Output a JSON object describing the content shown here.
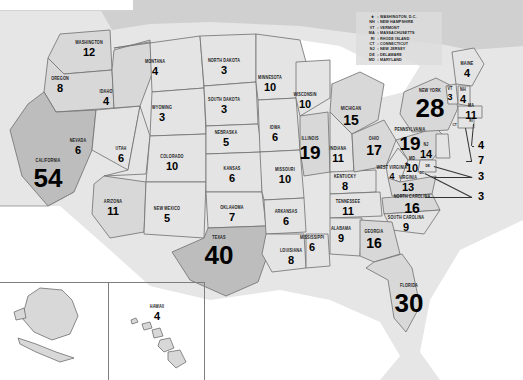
{
  "chart_data": {
    "type": "map",
    "unit": "electoral votes",
    "total": 538,
    "categories": [
      "Alabama",
      "Alaska",
      "Arizona",
      "Arkansas",
      "California",
      "Colorado",
      "Connecticut",
      "Delaware",
      "District of Columbia",
      "Florida",
      "Georgia",
      "Hawaii",
      "Idaho",
      "Illinois",
      "Indiana",
      "Iowa",
      "Kansas",
      "Kentucky",
      "Louisiana",
      "Maine",
      "Maryland",
      "Massachusetts",
      "Michigan",
      "Minnesota",
      "Mississippi",
      "Missouri",
      "Montana",
      "Nebraska",
      "Nevada",
      "New Hampshire",
      "New Jersey",
      "New Mexico",
      "New York",
      "North Carolina",
      "North Dakota",
      "Ohio",
      "Oklahoma",
      "Oregon",
      "Pennsylvania",
      "Rhode Island",
      "South Carolina",
      "South Dakota",
      "Tennessee",
      "Texas",
      "Utah",
      "Vermont",
      "Virginia",
      "Washington",
      "West Virginia",
      "Wisconsin",
      "Wyoming"
    ],
    "values": [
      9,
      3,
      11,
      6,
      54,
      10,
      7,
      3,
      3,
      30,
      16,
      4,
      4,
      19,
      11,
      6,
      6,
      8,
      8,
      4,
      10,
      11,
      15,
      10,
      6,
      10,
      4,
      5,
      6,
      4,
      14,
      5,
      28,
      16,
      3,
      17,
      7,
      8,
      19,
      4,
      9,
      3,
      11,
      40,
      6,
      3,
      13,
      12,
      4,
      10,
      3
    ]
  },
  "states": [
    {
      "id": "washington",
      "name": "WASHINGTON",
      "value": "12",
      "x": 89,
      "y": 49,
      "size": "sz-sm",
      "shade": "f-mid"
    },
    {
      "id": "oregon",
      "name": "OREGON",
      "value": "8",
      "x": 60,
      "y": 85,
      "size": "sz-sm",
      "shade": "f-mid"
    },
    {
      "id": "california",
      "name": "CALIFORNIA",
      "value": "54",
      "x": 48,
      "y": 175,
      "size": "sz-xl",
      "shade": "f-dark"
    },
    {
      "id": "nevada",
      "name": "NEVADA",
      "value": "6",
      "x": 78,
      "y": 147,
      "size": "sz-sm",
      "shade": "f-light"
    },
    {
      "id": "idaho",
      "name": "IDAHO",
      "value": "4",
      "x": 106,
      "y": 98,
      "size": "sz-sm",
      "shade": "f-mid"
    },
    {
      "id": "montana",
      "name": "MONTANA",
      "value": "4",
      "x": 155,
      "y": 68,
      "size": "sz-sm",
      "shade": "f-light"
    },
    {
      "id": "wyoming",
      "name": "WYOMING",
      "value": "3",
      "x": 162,
      "y": 114,
      "size": "sz-sm",
      "shade": "f-light"
    },
    {
      "id": "utah",
      "name": "UTAH",
      "value": "6",
      "x": 121,
      "y": 155,
      "size": "sz-sm",
      "shade": "f-light"
    },
    {
      "id": "colorado",
      "name": "COLORADO",
      "value": "10",
      "x": 172,
      "y": 163,
      "size": "sz-sm",
      "shade": "f-light"
    },
    {
      "id": "arizona",
      "name": "ARIZONA",
      "value": "11",
      "x": 113,
      "y": 208,
      "size": "sz-sm",
      "shade": "f-mid"
    },
    {
      "id": "new-mexico",
      "name": "NEW MEXICO",
      "value": "5",
      "x": 167,
      "y": 215,
      "size": "sz-sm",
      "shade": "f-light"
    },
    {
      "id": "north-dakota",
      "name": "NORTH DAKOTA",
      "value": "3",
      "x": 224,
      "y": 67,
      "size": "sz-sm",
      "shade": "f-light"
    },
    {
      "id": "south-dakota",
      "name": "SOUTH DAKOTA",
      "value": "3",
      "x": 224,
      "y": 106,
      "size": "sz-sm",
      "shade": "f-light"
    },
    {
      "id": "nebraska",
      "name": "NEBRASKA",
      "value": "5",
      "x": 226,
      "y": 139,
      "size": "sz-sm",
      "shade": "f-light"
    },
    {
      "id": "kansas",
      "name": "KANSAS",
      "value": "6",
      "x": 232,
      "y": 175,
      "size": "sz-sm",
      "shade": "f-light"
    },
    {
      "id": "oklahoma",
      "name": "OKLAHOMA",
      "value": "7",
      "x": 232,
      "y": 214,
      "size": "sz-sm",
      "shade": "f-light"
    },
    {
      "id": "texas",
      "name": "TEXAS",
      "value": "40",
      "x": 219,
      "y": 252,
      "size": "sz-xl",
      "shade": "f-dark"
    },
    {
      "id": "minnesota",
      "name": "MINNESOTA",
      "value": "10",
      "x": 270,
      "y": 84,
      "size": "sz-sm",
      "shade": "f-light"
    },
    {
      "id": "iowa",
      "name": "IOWA",
      "value": "6",
      "x": 275,
      "y": 134,
      "size": "sz-sm",
      "shade": "f-light"
    },
    {
      "id": "missouri",
      "name": "MISSOURI",
      "value": "10",
      "x": 285,
      "y": 176,
      "size": "sz-sm",
      "shade": "f-light"
    },
    {
      "id": "arkansas",
      "name": "ARKANSAS",
      "value": "6",
      "x": 286,
      "y": 218,
      "size": "sz-sm",
      "shade": "f-light"
    },
    {
      "id": "louisiana",
      "name": "LOUISIANA",
      "value": "8",
      "x": 291,
      "y": 257,
      "size": "sz-sm",
      "shade": "f-light"
    },
    {
      "id": "wisconsin",
      "name": "WISCONSIN",
      "value": "10",
      "x": 305,
      "y": 101,
      "size": "sz-sm",
      "shade": "f-light"
    },
    {
      "id": "illinois",
      "name": "ILLINOIS",
      "value": "19",
      "x": 310,
      "y": 149,
      "size": "sz-lg",
      "shade": "f-mid"
    },
    {
      "id": "mississippi",
      "name": "MISSISSIPPI",
      "value": "6",
      "x": 312,
      "y": 244,
      "size": "sz-sm",
      "shade": "f-light"
    },
    {
      "id": "michigan",
      "name": "MICHIGAN",
      "value": "15",
      "x": 351,
      "y": 117,
      "size": "sz-md",
      "shade": "f-mid"
    },
    {
      "id": "indiana",
      "name": "INDIANA",
      "value": "11",
      "x": 338,
      "y": 155,
      "size": "sz-sm",
      "shade": "f-light"
    },
    {
      "id": "kentucky",
      "name": "KENTUCKY",
      "value": "8",
      "x": 345,
      "y": 183,
      "size": "sz-sm",
      "shade": "f-light"
    },
    {
      "id": "tennessee",
      "name": "TENNESSEE",
      "value": "11",
      "x": 348,
      "y": 208,
      "size": "sz-sm",
      "shade": "f-light"
    },
    {
      "id": "alabama",
      "name": "ALABAMA",
      "value": "9",
      "x": 341,
      "y": 235,
      "size": "sz-sm",
      "shade": "f-light"
    },
    {
      "id": "ohio",
      "name": "OHIO",
      "value": "17",
      "x": 374,
      "y": 147,
      "size": "sz-md",
      "shade": "f-mid"
    },
    {
      "id": "west-virginia",
      "name": "WEST VIRGINIA",
      "value": "4",
      "x": 392,
      "y": 173,
      "size": "sz-xs",
      "shade": "f-light"
    },
    {
      "id": "virginia",
      "name": "VIRGINIA",
      "value": "13",
      "x": 408,
      "y": 184,
      "size": "sz-sm",
      "shade": "f-mid"
    },
    {
      "id": "north-carolina",
      "name": "NORTH CAROLINA",
      "value": "16",
      "x": 412,
      "y": 205,
      "size": "sz-md",
      "shade": "f-mid"
    },
    {
      "id": "south-carolina",
      "name": "SOUTH CAROLINA",
      "value": "9",
      "x": 406,
      "y": 224,
      "size": "sz-sm",
      "shade": "f-light"
    },
    {
      "id": "georgia",
      "name": "GEORGIA",
      "value": "16",
      "x": 374,
      "y": 240,
      "size": "sz-md",
      "shade": "f-mid"
    },
    {
      "id": "florida",
      "name": "FLORIDA",
      "value": "30",
      "x": 409,
      "y": 300,
      "size": "sz-xl",
      "shade": "f-mid"
    },
    {
      "id": "pennsylvania",
      "name": "PENNSYLVANIA",
      "value": "19",
      "x": 410,
      "y": 140,
      "size": "sz-lg",
      "shade": "f-mid"
    },
    {
      "id": "new-york",
      "name": "NEW YORK",
      "value": "28",
      "x": 430,
      "y": 105,
      "size": "sz-xl",
      "shade": "f-mid"
    },
    {
      "id": "maine",
      "name": "MAINE",
      "value": "4",
      "x": 467,
      "y": 70,
      "size": "sz-sm",
      "shade": "f-light"
    },
    {
      "id": "vermont",
      "name": "VT",
      "value": "3",
      "x": 450,
      "y": 94,
      "size": "sz-xs",
      "shade": "f-light"
    },
    {
      "id": "new-hampshire",
      "name": "NH",
      "value": "4",
      "x": 463,
      "y": 96,
      "size": "sz-sm",
      "shade": "f-light"
    },
    {
      "id": "massachusetts",
      "name": "MA",
      "value": "11",
      "x": 471,
      "y": 112,
      "size": "sz-sm",
      "shade": "f-light"
    },
    {
      "id": "new-jersey",
      "name": "NJ",
      "value": "14",
      "x": 426,
      "y": 151,
      "size": "sz-sm",
      "shade": "f-light"
    },
    {
      "id": "maryland",
      "name": "MD",
      "value": "10",
      "x": 412,
      "y": 165,
      "size": "sz-sm",
      "shade": "f-light"
    },
    {
      "id": "alaska",
      "name": "ALASKA",
      "value": "3",
      "x": 53,
      "y": 313,
      "size": "sz-sm",
      "shade": "f-mid"
    },
    {
      "id": "hawaii",
      "name": "HAWAII",
      "value": "4",
      "x": 157,
      "y": 313,
      "size": "sz-sm",
      "shade": "f-mid"
    }
  ],
  "callouts": [
    {
      "id": "rhode-island",
      "abbr": "RI",
      "value": "4",
      "vx": 478,
      "vy": 146
    },
    {
      "id": "connecticut",
      "abbr": "CT",
      "value": "7",
      "vx": 478,
      "vy": 161
    },
    {
      "id": "delaware",
      "abbr": "DE",
      "value": "3",
      "vx": 478,
      "vy": 177
    },
    {
      "id": "dc",
      "abbr": "DC",
      "value": "3",
      "vx": 478,
      "vy": 197
    }
  ],
  "legend": {
    "rows": [
      {
        "abbr": "★",
        "name": "WASHINGTON, D.C."
      },
      {
        "abbr": "NH",
        "name": "NEW HAMPSHIRE"
      },
      {
        "abbr": "VT",
        "name": "VERMONT"
      },
      {
        "abbr": "MA",
        "name": "MASSACHUSETTS"
      },
      {
        "abbr": "RI",
        "name": "RHODE ISLAND"
      },
      {
        "abbr": "CT",
        "name": "CONNECTICUT"
      },
      {
        "abbr": "NJ",
        "name": "NEW JERSEY"
      },
      {
        "abbr": "DE",
        "name": "DELAWARE"
      },
      {
        "abbr": "MD",
        "name": "MARYLAND"
      }
    ],
    "separator": ":"
  },
  "inset_labels": {
    "ct_tiny": "CT",
    "ri_tiny": "RI",
    "de_tiny": "DE",
    "dc_tiny": "DC",
    "md_tiny": "MD"
  }
}
